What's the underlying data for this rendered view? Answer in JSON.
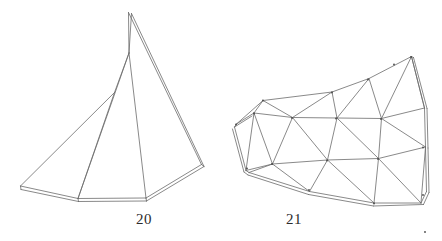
{
  "page": {
    "background_color": "#ffffff",
    "width": 442,
    "height": 241,
    "kind": "line-drawing-plate"
  },
  "style": {
    "stroke_color": "#6b6b6b",
    "stroke_color_dark": "#4a4a4a",
    "stroke_width": 0.8,
    "caption_color": "#2b2b2b"
  },
  "figures": [
    {
      "id": "figure-20",
      "caption": "20",
      "caption_x": 136,
      "caption_y": 212,
      "kind": "folded-fan-cone",
      "vertices": {
        "apex": [
          128.5,
          12.5
        ],
        "apex_b": [
          131.5,
          13.5
        ],
        "fold_upper": [
          129.0,
          53.0
        ],
        "fold_mid": [
          114.5,
          92.5
        ],
        "left": [
          20.5,
          186.0
        ],
        "left_b": [
          21.0,
          189.5
        ],
        "base_l": [
          78.0,
          198.5
        ],
        "base_l_b": [
          78.5,
          201.5
        ],
        "base_r": [
          146.0,
          198.0
        ],
        "base_r_b": [
          146.5,
          201.0
        ],
        "right": [
          201.5,
          164.5
        ],
        "right_b": [
          204.0,
          166.5
        ]
      },
      "polylines": [
        [
          [
            128.5,
            12.5
          ],
          [
            201.5,
            164.5
          ]
        ],
        [
          [
            131.5,
            13.5
          ],
          [
            204.0,
            166.5
          ]
        ],
        [
          [
            128.5,
            12.5
          ],
          [
            129.0,
            53.0
          ]
        ],
        [
          [
            131.5,
            13.5
          ],
          [
            129.0,
            53.0
          ]
        ],
        [
          [
            129.0,
            53.0
          ],
          [
            114.5,
            92.5
          ]
        ],
        [
          [
            129.0,
            53.0
          ],
          [
            146.0,
            198.0
          ]
        ],
        [
          [
            129.0,
            53.0
          ],
          [
            78.0,
            198.5
          ]
        ],
        [
          [
            114.5,
            92.5
          ],
          [
            20.5,
            186.0
          ]
        ],
        [
          [
            114.5,
            92.5
          ],
          [
            78.0,
            198.5
          ]
        ],
        [
          [
            20.5,
            186.0
          ],
          [
            78.0,
            198.5
          ]
        ],
        [
          [
            21.0,
            189.5
          ],
          [
            78.5,
            201.5
          ]
        ],
        [
          [
            20.5,
            186.0
          ],
          [
            21.0,
            189.5
          ]
        ],
        [
          [
            78.0,
            198.5
          ],
          [
            146.0,
            198.0
          ]
        ],
        [
          [
            78.5,
            201.5
          ],
          [
            146.5,
            201.0
          ]
        ],
        [
          [
            78.0,
            198.5
          ],
          [
            78.5,
            201.5
          ]
        ],
        [
          [
            146.0,
            198.0
          ],
          [
            146.5,
            201.0
          ]
        ],
        [
          [
            146.0,
            198.0
          ],
          [
            201.5,
            164.5
          ]
        ],
        [
          [
            146.5,
            201.0
          ],
          [
            204.0,
            166.5
          ]
        ],
        [
          [
            201.5,
            164.5
          ],
          [
            204.0,
            166.5
          ]
        ]
      ]
    },
    {
      "id": "figure-21",
      "caption": "21",
      "caption_x": 286,
      "caption_y": 212,
      "kind": "triangulated-curved-strip",
      "grid_rows": [
        [
          [
            263.0,
            100.5
          ],
          [
            332.0,
            92.5
          ],
          [
            368.0,
            79.5
          ],
          [
            394.0,
            64.5
          ],
          [
            411.0,
            57.0
          ]
        ],
        [
          [
            254.0,
            113.5
          ],
          [
            292.0,
            118.0
          ],
          [
            336.0,
            118.5
          ],
          [
            381.0,
            119.0
          ],
          [
            423.0,
            147.5
          ]
        ],
        [
          [
            236.0,
            124.5
          ],
          [
            272.0,
            164.0
          ],
          [
            327.0,
            160.5
          ],
          [
            378.0,
            159.0
          ],
          [
            423.0,
            195.0
          ]
        ],
        [
          [
            247.0,
            168.5
          ],
          [
            309.0,
            190.0
          ],
          [
            374.0,
            203.5
          ],
          [
            425.0,
            232.0
          ]
        ]
      ],
      "polylines": [
        [
          [
            236.5,
            124.0
          ],
          [
            263.0,
            100.5
          ],
          [
            332.0,
            92.0
          ],
          [
            369.0,
            78.5
          ],
          [
            411.5,
            56.5
          ]
        ],
        [
          [
            411.5,
            56.5
          ],
          [
            424.5,
            108.0
          ]
        ],
        [
          [
            413.5,
            57.5
          ],
          [
            427.0,
            108.5
          ]
        ],
        [
          [
            411.5,
            56.5
          ],
          [
            413.5,
            57.5
          ]
        ],
        [
          [
            424.5,
            108.0
          ],
          [
            425.5,
            147.0
          ]
        ],
        [
          [
            427.0,
            108.5
          ],
          [
            428.0,
            148.0
          ]
        ],
        [
          [
            425.5,
            147.0
          ],
          [
            426.5,
            191.5
          ]
        ],
        [
          [
            428.0,
            148.0
          ],
          [
            429.0,
            192.5
          ]
        ],
        [
          [
            426.5,
            191.5
          ],
          [
            421.0,
            203.0
          ]
        ],
        [
          [
            429.0,
            192.5
          ],
          [
            423.5,
            204.5
          ]
        ],
        [
          [
            236.5,
            124.0
          ],
          [
            254.0,
            113.0
          ]
        ],
        [
          [
            234.5,
            127.0
          ],
          [
            252.0,
            116.0
          ]
        ],
        [
          [
            236.5,
            124.0
          ],
          [
            234.5,
            127.0
          ]
        ],
        [
          [
            234.5,
            127.0
          ],
          [
            246.0,
            170.5
          ]
        ],
        [
          [
            232.5,
            129.0
          ],
          [
            244.0,
            172.0
          ]
        ],
        [
          [
            246.0,
            170.5
          ],
          [
            249.0,
            172.5
          ]
        ],
        [
          [
            244.0,
            172.0
          ],
          [
            248.0,
            175.0
          ]
        ],
        [
          [
            249.0,
            172.5
          ],
          [
            309.5,
            191.5
          ]
        ],
        [
          [
            248.0,
            175.0
          ],
          [
            308.5,
            194.5
          ]
        ],
        [
          [
            309.5,
            191.5
          ],
          [
            374.0,
            203.0
          ]
        ],
        [
          [
            308.5,
            194.5
          ],
          [
            373.5,
            206.0
          ]
        ],
        [
          [
            374.0,
            203.0
          ],
          [
            421.0,
            203.0
          ]
        ],
        [
          [
            373.5,
            206.0
          ],
          [
            423.5,
            204.5
          ]
        ],
        [
          [
            254.0,
            113.0
          ],
          [
            292.5,
            117.5
          ]
        ],
        [
          [
            292.5,
            117.5
          ],
          [
            337.0,
            118.0
          ]
        ],
        [
          [
            337.0,
            118.0
          ],
          [
            381.5,
            118.5
          ]
        ],
        [
          [
            381.5,
            118.5
          ],
          [
            424.5,
            108.0
          ]
        ],
        [
          [
            246.0,
            170.5
          ],
          [
            272.5,
            164.0
          ]
        ],
        [
          [
            272.5,
            164.0
          ],
          [
            327.5,
            160.0
          ]
        ],
        [
          [
            327.5,
            160.0
          ],
          [
            378.5,
            158.5
          ]
        ],
        [
          [
            378.5,
            158.5
          ],
          [
            425.5,
            147.0
          ]
        ],
        [
          [
            263.0,
            100.5
          ],
          [
            254.0,
            113.0
          ]
        ],
        [
          [
            263.0,
            100.5
          ],
          [
            292.5,
            117.5
          ]
        ],
        [
          [
            332.0,
            92.0
          ],
          [
            292.5,
            117.5
          ]
        ],
        [
          [
            332.0,
            92.0
          ],
          [
            337.0,
            118.0
          ]
        ],
        [
          [
            369.0,
            78.5
          ],
          [
            337.0,
            118.0
          ]
        ],
        [
          [
            369.0,
            78.5
          ],
          [
            381.5,
            118.5
          ]
        ],
        [
          [
            411.5,
            56.5
          ],
          [
            381.5,
            118.5
          ]
        ],
        [
          [
            411.5,
            56.5
          ],
          [
            424.5,
            108.0
          ]
        ],
        [
          [
            254.0,
            113.0
          ],
          [
            246.0,
            170.5
          ]
        ],
        [
          [
            254.0,
            113.0
          ],
          [
            272.5,
            164.0
          ]
        ],
        [
          [
            292.5,
            117.5
          ],
          [
            272.5,
            164.0
          ]
        ],
        [
          [
            292.5,
            117.5
          ],
          [
            327.5,
            160.0
          ]
        ],
        [
          [
            337.0,
            118.0
          ],
          [
            327.5,
            160.0
          ]
        ],
        [
          [
            337.0,
            118.0
          ],
          [
            378.5,
            158.5
          ]
        ],
        [
          [
            381.5,
            118.5
          ],
          [
            378.5,
            158.5
          ]
        ],
        [
          [
            381.5,
            118.5
          ],
          [
            425.5,
            147.0
          ]
        ],
        [
          [
            272.5,
            164.0
          ],
          [
            249.0,
            172.5
          ]
        ],
        [
          [
            272.5,
            164.0
          ],
          [
            309.5,
            191.5
          ]
        ],
        [
          [
            327.5,
            160.0
          ],
          [
            309.5,
            191.5
          ]
        ],
        [
          [
            327.5,
            160.0
          ],
          [
            374.0,
            203.0
          ]
        ],
        [
          [
            378.5,
            158.5
          ],
          [
            374.0,
            203.0
          ]
        ],
        [
          [
            378.5,
            158.5
          ],
          [
            421.0,
            203.0
          ]
        ],
        [
          [
            425.5,
            147.0
          ],
          [
            421.0,
            203.0
          ]
        ]
      ]
    }
  ]
}
